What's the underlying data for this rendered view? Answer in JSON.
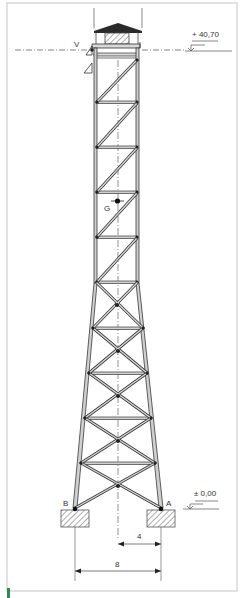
{
  "figure": {
    "type": "structural-elevation"
  },
  "labels": {
    "top_level": "+ 40,70",
    "ground_level": "± 0,00",
    "point_v": "V",
    "point_g": "G",
    "support_a": "A",
    "support_b": "B",
    "dim_half_base": "4",
    "dim_full_base": "8"
  },
  "colors": {
    "line": "#3a3a3a",
    "member_fill": "#c8c8c8",
    "frame": "#cfcfcf",
    "roof": "#2a2a2a",
    "hatch": "#777777",
    "accent": "#2e8b57"
  }
}
